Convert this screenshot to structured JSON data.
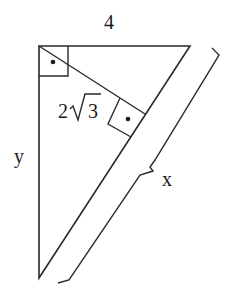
{
  "diagram": {
    "type": "right-triangle-with-altitude",
    "labels": {
      "top_side": "4",
      "altitude": "2",
      "altitude_radical": "3",
      "left_side": "y",
      "hypotenuse_brace": "x"
    },
    "right_angle_markers": [
      {
        "position": "top-left-vertex"
      },
      {
        "position": "altitude-foot-on-hypotenuse"
      }
    ],
    "colors": {
      "stroke": "#2a2a2a",
      "background": "#ffffff"
    }
  }
}
